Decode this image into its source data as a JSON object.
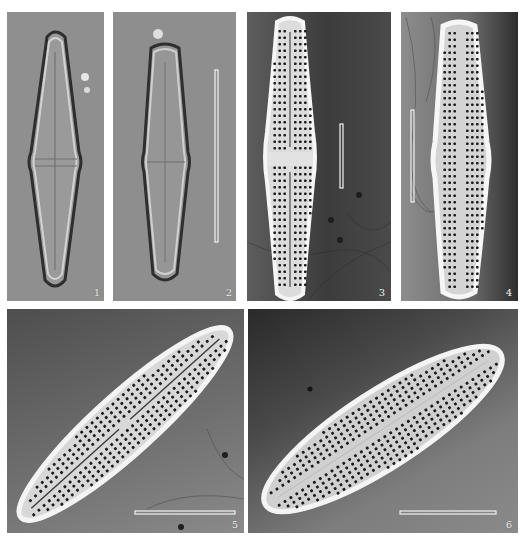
{
  "figure": {
    "type": "diatom micrograph plate",
    "panels": [
      {
        "id": "1",
        "label": "1",
        "technique": "light-microscopy",
        "scale_bar": false
      },
      {
        "id": "2",
        "label": "2",
        "technique": "light-microscopy",
        "scale_bar": true
      },
      {
        "id": "3",
        "label": "3",
        "technique": "scanning-electron-microscopy",
        "scale_bar": true
      },
      {
        "id": "4",
        "label": "4",
        "technique": "scanning-electron-microscopy",
        "scale_bar": true
      },
      {
        "id": "5",
        "label": "5",
        "technique": "scanning-electron-microscopy",
        "scale_bar": true
      },
      {
        "id": "6",
        "label": "6",
        "technique": "scanning-electron-microscopy",
        "scale_bar": true
      }
    ]
  },
  "colors": {
    "background": "#ffffff",
    "lm_background": "#8f8f8f",
    "sem_valve": "#e8e8e8",
    "scale_bar": "#f4f4f4",
    "areolae": "#1c1c1c"
  }
}
